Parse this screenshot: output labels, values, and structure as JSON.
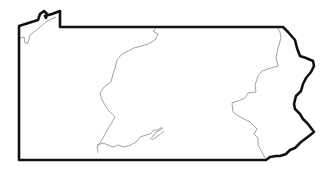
{
  "map": {
    "title": "Pennsylvania",
    "type": "state-outline",
    "colors": {
      "background": "#ffffff",
      "border": "#111111",
      "internal_lines": "#8a8a8a"
    },
    "regions": [
      "west",
      "central",
      "east"
    ]
  }
}
